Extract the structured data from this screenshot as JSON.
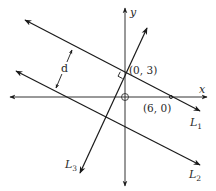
{
  "diagram": {
    "axes": {
      "x_label": "x",
      "y_label": "y"
    },
    "points": [
      {
        "label": "(0, 3)",
        "x": 0,
        "y": 3
      },
      {
        "label": "(6, 0)",
        "x": 6,
        "y": 0
      }
    ],
    "lines": [
      {
        "name": "L",
        "sub": "1",
        "label": "L1"
      },
      {
        "name": "L",
        "sub": "2",
        "label": "L2"
      },
      {
        "name": "L",
        "sub": "3",
        "label": "L3"
      }
    ],
    "distance_label": "d",
    "colors": {
      "line": "#1a1a1a",
      "axis": "#333333",
      "background": "#ffffff"
    }
  }
}
